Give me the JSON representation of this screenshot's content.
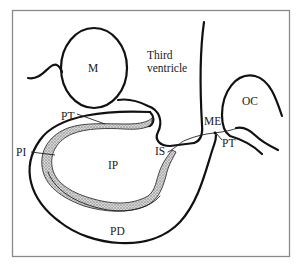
{
  "figure": {
    "type": "anatomical-diagram",
    "colors": {
      "ink": "#111111",
      "frame": "#8a8a8a",
      "background": "#ffffff",
      "stipple": "#9a9a9a"
    }
  },
  "labels": {
    "m": "M",
    "third_ventricle_line1": "Third",
    "third_ventricle_line2": "ventricle",
    "oc": "OC",
    "me": "ME",
    "pt_left": "PT",
    "pt_right": "PT",
    "pi": "PI",
    "ip": "IP",
    "is": "IS",
    "pd": "PD"
  }
}
